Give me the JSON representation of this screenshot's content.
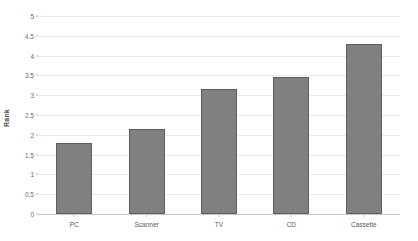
{
  "chart_data": {
    "type": "bar",
    "title": "",
    "subtitle": "",
    "xlabel": "",
    "ylabel": "Rank",
    "categories": [
      "PC",
      "Scanner",
      "TV",
      "CD",
      "Cassette"
    ],
    "values": [
      1.8,
      2.15,
      3.15,
      3.45,
      4.3
    ],
    "series": [
      {
        "name": "Rank",
        "values": [
          1.8,
          2.15,
          3.15,
          3.45,
          4.3
        ]
      }
    ],
    "ylim": [
      0,
      5
    ],
    "ytick_step": 0.5,
    "ytick_labels": [
      "0",
      "0.5",
      "1",
      "1.5",
      "2",
      "2.5",
      "3",
      "3.5",
      "4",
      "4.5",
      "5"
    ],
    "ytick_values": [
      0,
      0.5,
      1,
      1.5,
      2,
      2.5,
      3,
      3.5,
      4,
      4.5,
      5
    ],
    "grid": true,
    "grid_axis": "y",
    "legend": false,
    "legend_position": "none",
    "bar_color": "#808080",
    "bar_border_color": "#5e5e5e",
    "gridline_color": "#e9e9e9",
    "axis_color": "#c9c9c9",
    "background_color": "#ffffff",
    "text_color": "#5a5a5a"
  }
}
